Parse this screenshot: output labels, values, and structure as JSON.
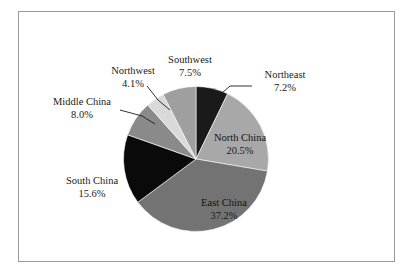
{
  "figure": {
    "background_color": "#ffffff",
    "frame_color": "#9a9a9a"
  },
  "chart_data": {
    "type": "pie",
    "title": "",
    "subtitle": "",
    "xlabel": "",
    "ylabel": "",
    "legend_position": "none",
    "grid": false,
    "start_angle_deg": 0,
    "direction": "clockwise",
    "categories": [
      "Northeast",
      "North China",
      "East China",
      "South China",
      "Middle China",
      "Northwest",
      "Southwest"
    ],
    "values": [
      7.2,
      20.5,
      37.2,
      15.6,
      8.0,
      4.1,
      7.5
    ],
    "value_labels": [
      "7.2%",
      "20.5%",
      "37.2%",
      "15.6%",
      "8.0%",
      "4.1%",
      "7.5%"
    ],
    "colors": [
      "#1a1a1a",
      "#a8a8a8",
      "#737373",
      "#0a0a0a",
      "#8a8a8a",
      "#d9d9d9",
      "#9f9f9f"
    ],
    "label_placement": [
      "outside",
      "inside",
      "inside",
      "outside",
      "outside",
      "outside",
      "outside"
    ],
    "units": "percent",
    "total": 100.1
  },
  "labels": {
    "northeast": {
      "name": "Northeast",
      "value": "7.2%"
    },
    "north_china": {
      "name": "North China",
      "value": "20.5%"
    },
    "east_china": {
      "name": "East China",
      "value": "37.2%"
    },
    "south_china": {
      "name": "South China",
      "value": "15.6%"
    },
    "middle_china": {
      "name": "Middle China",
      "value": "8.0%"
    },
    "northwest": {
      "name": "Northwest",
      "value": "4.1%"
    },
    "southwest": {
      "name": "Southwest",
      "value": "7.5%"
    }
  }
}
